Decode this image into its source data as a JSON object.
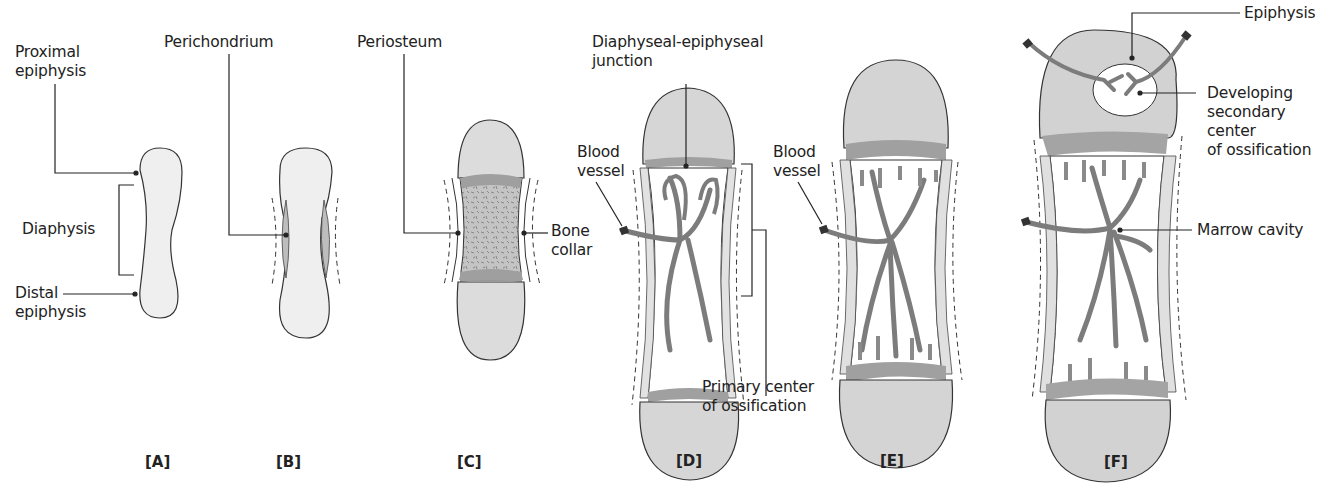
{
  "top_cut_text": "...diaphysis, bone collar, marrow cavity...",
  "colors": {
    "cartilage": "#ededed",
    "epiphysis_fill": "#d2d2d2",
    "junction_band": "#a9a9a9",
    "vessel": "#8c8c8c",
    "outline": "#333333",
    "text": "#222222"
  },
  "panels": [
    {
      "id": "A",
      "label": "[A]"
    },
    {
      "id": "B",
      "label": "[B]"
    },
    {
      "id": "C",
      "label": "[C]"
    },
    {
      "id": "D",
      "label": "[D]"
    },
    {
      "id": "E",
      "label": "[E]"
    },
    {
      "id": "F",
      "label": "[F]"
    }
  ],
  "labels": {
    "proximal_epiphysis": "Proximal\nepiphysis",
    "diaphysis": "Diaphysis",
    "distal_epiphysis": "Distal\nepiphysis",
    "perichondrium": "Perichondrium",
    "periosteum": "Periosteum",
    "bone_collar": "Bone\ncollar",
    "diaphyseal_epiphyseal_junction": "Diaphyseal-epiphyseal\njunction",
    "blood_vessel_d": "Blood\nvessel",
    "primary_center": "Primary center\nof ossification",
    "blood_vessel_e": "Blood\nvessel",
    "epiphysis": "Epiphysis",
    "developing_secondary_center": "Developing\nsecondary\ncenter\nof ossification",
    "marrow_cavity": "Marrow cavity"
  }
}
